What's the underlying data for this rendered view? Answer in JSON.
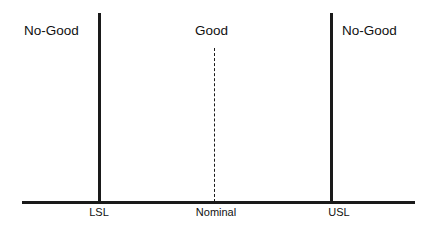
{
  "diagram": {
    "zones": [
      {
        "id": "left-nogood",
        "label": "No-Good"
      },
      {
        "id": "good",
        "label": "Good"
      },
      {
        "id": "right-nogood",
        "label": "No-Good"
      }
    ],
    "axis": {
      "ticks": [
        {
          "id": "lsl",
          "label": "LSL"
        },
        {
          "id": "nominal",
          "label": "Nominal"
        },
        {
          "id": "usl",
          "label": "USL"
        }
      ]
    },
    "colors": {
      "line": "#1a1a1a",
      "text": "#111111",
      "background": "#ffffff"
    }
  }
}
